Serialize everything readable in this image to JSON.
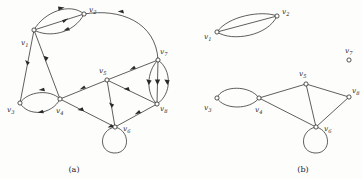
{
  "figure": {
    "width": 362,
    "height": 179,
    "background_color": "#fdfdfc",
    "ink_color": "#2a2a2a",
    "panels": [
      {
        "id": "panel-a",
        "caption": "(a)",
        "caption_pos": {
          "x": 74,
          "y": 171
        },
        "type": "directed-multigraph",
        "vertices": [
          {
            "id": "v1",
            "label": "v",
            "sub": "1",
            "x": 34,
            "y": 30,
            "label_x": 21,
            "label_y": 45
          },
          {
            "id": "v2",
            "label": "v",
            "sub": "2",
            "x": 84,
            "y": 14,
            "label_x": 89,
            "label_y": 12
          },
          {
            "id": "v3",
            "label": "v",
            "sub": "3",
            "x": 20,
            "y": 103,
            "label_x": 7,
            "label_y": 112
          },
          {
            "id": "v4",
            "label": "v",
            "sub": "4",
            "x": 60,
            "y": 99,
            "label_x": 59,
            "label_y": 113
          },
          {
            "id": "v5",
            "label": "v",
            "sub": "5",
            "x": 107,
            "y": 80,
            "label_x": 100,
            "label_y": 72
          },
          {
            "id": "v6",
            "label": "v",
            "sub": "6",
            "x": 115,
            "y": 127,
            "label_x": 124,
            "label_y": 131
          },
          {
            "id": "v7",
            "label": "v",
            "sub": "7",
            "x": 158,
            "y": 60,
            "label_x": 161,
            "label_y": 54
          },
          {
            "id": "v8",
            "label": "v",
            "sub": "8",
            "x": 157,
            "y": 104,
            "label_x": 160,
            "label_y": 110
          }
        ],
        "edges": [
          {
            "from": "v2",
            "to": "v1",
            "style": "arc-up",
            "note": "upper parallel edge, arrow toward v1"
          },
          {
            "from": "v2",
            "to": "v1",
            "style": "straight",
            "note": "middle parallel edge, arrow toward v1"
          },
          {
            "from": "v1",
            "to": "v2",
            "style": "arc-down",
            "note": "lower parallel edge, arrow toward v2"
          },
          {
            "from": "v2",
            "to": "v7",
            "style": "long-arc",
            "note": "sweeping arc over top right"
          },
          {
            "from": "v1",
            "to": "v3",
            "style": "straight",
            "note": "arrow toward v3"
          },
          {
            "from": "v1",
            "to": "v4",
            "style": "straight",
            "note": "arrow toward v4"
          },
          {
            "from": "v3",
            "to": "v4",
            "style": "arc-up",
            "note": "upper parallel edge, arrow toward v4"
          },
          {
            "from": "v3",
            "to": "v4",
            "style": "arc-down",
            "note": "lower parallel edge, arrow toward v4"
          },
          {
            "from": "v4",
            "to": "v5",
            "style": "straight",
            "note": "arrow toward v5"
          },
          {
            "from": "v5",
            "to": "v7",
            "style": "straight",
            "note": "arrow toward v7"
          },
          {
            "from": "v5",
            "to": "v8",
            "style": "straight",
            "note": "arrow toward v8"
          },
          {
            "from": "v5",
            "to": "v6",
            "style": "straight",
            "note": "arrow toward v6"
          },
          {
            "from": "v4",
            "to": "v6",
            "style": "straight",
            "note": "arrow toward v6"
          },
          {
            "from": "v6",
            "to": "v8",
            "style": "straight",
            "note": "arrow toward v8"
          },
          {
            "from": "v7",
            "to": "v8",
            "style": "arc-left",
            "note": "left parallel edge, arrow toward v8"
          },
          {
            "from": "v7",
            "to": "v8",
            "style": "straight",
            "note": "middle parallel edge, arrow toward v8"
          },
          {
            "from": "v7",
            "to": "v8",
            "style": "arc-right",
            "note": "right parallel edge, arrow toward v8"
          },
          {
            "from": "v6",
            "to": "v6",
            "style": "self-loop",
            "note": "self loop below v6"
          }
        ]
      },
      {
        "id": "panel-b",
        "caption": "(b)",
        "caption_pos": {
          "x": 300,
          "y": 171
        },
        "type": "undirected-multigraph",
        "vertices": [
          {
            "id": "v1",
            "label": "v",
            "sub": "1",
            "x": 217,
            "y": 32,
            "label_x": 204,
            "label_y": 38
          },
          {
            "id": "v2",
            "label": "v",
            "sub": "2",
            "x": 277,
            "y": 16,
            "label_x": 283,
            "label_y": 14
          },
          {
            "id": "v3",
            "label": "v",
            "sub": "3",
            "x": 217,
            "y": 98,
            "label_x": 204,
            "label_y": 112
          },
          {
            "id": "v4",
            "label": "v",
            "sub": "4",
            "x": 259,
            "y": 98,
            "label_x": 257,
            "label_y": 113
          },
          {
            "id": "v5",
            "label": "v",
            "sub": "5",
            "x": 306,
            "y": 84,
            "label_x": 299,
            "label_y": 75
          },
          {
            "id": "v6",
            "label": "v",
            "sub": "6",
            "x": 316,
            "y": 127,
            "label_x": 325,
            "label_y": 131
          },
          {
            "id": "v7",
            "label": "v",
            "sub": "7",
            "x": 349,
            "y": 60,
            "label_x": 347,
            "label_y": 52
          },
          {
            "id": "v8",
            "label": "v",
            "sub": "8",
            "x": 349,
            "y": 97,
            "label_x": 352,
            "label_y": 92
          }
        ],
        "edges": [
          {
            "from": "v1",
            "to": "v2",
            "style": "arc-up",
            "note": "upper parallel edge"
          },
          {
            "from": "v1",
            "to": "v2",
            "style": "straight",
            "note": "middle parallel edge"
          },
          {
            "from": "v1",
            "to": "v2",
            "style": "arc-down",
            "note": "lower parallel edge"
          },
          {
            "from": "v3",
            "to": "v4",
            "style": "arc-up",
            "note": "upper parallel edge"
          },
          {
            "from": "v3",
            "to": "v4",
            "style": "arc-down",
            "note": "lower parallel edge"
          },
          {
            "from": "v4",
            "to": "v5",
            "style": "straight",
            "note": ""
          },
          {
            "from": "v4",
            "to": "v6",
            "style": "straight",
            "note": ""
          },
          {
            "from": "v5",
            "to": "v6",
            "style": "straight",
            "note": ""
          },
          {
            "from": "v5",
            "to": "v8",
            "style": "straight",
            "note": ""
          },
          {
            "from": "v6",
            "to": "v8",
            "style": "straight",
            "note": ""
          },
          {
            "from": "v6",
            "to": "v6",
            "style": "self-loop",
            "note": "self loop below v6"
          }
        ],
        "isolated_vertices": [
          "v7"
        ]
      }
    ]
  }
}
